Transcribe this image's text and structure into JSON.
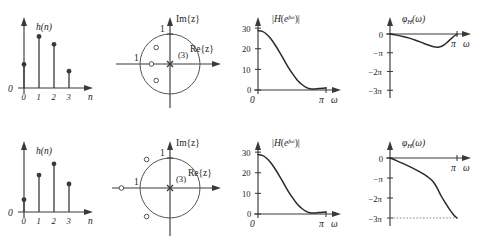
{
  "figure": {
    "colors": {
      "axis": "#3a3a3a",
      "curve": "#2a2a2a",
      "circle": "#555555",
      "dotted_reference": "#8a8a8a",
      "background": "#ffffff"
    }
  },
  "rows": [
    {
      "id": "minimum-phase",
      "impulse": {
        "ylabel": "h(n)",
        "xlabel": "n",
        "origin_label": "0",
        "xticks": [
          "0",
          "1",
          "2",
          "3"
        ],
        "samples": [
          {
            "n": 0,
            "value": 0.42
          },
          {
            "n": 1,
            "value": 0.92
          },
          {
            "n": 2,
            "value": 0.78
          },
          {
            "n": 3,
            "value": 0.3
          }
        ]
      },
      "polezero": {
        "imag_label": "Im{z}",
        "real_label": "Re{z}",
        "unit_label_imag": "1",
        "unit_label_real": "1",
        "pole_order_label": "(3)",
        "pole_at_origin_order": 3,
        "unit_circle_radius": 1,
        "zeros": [
          {
            "re": -0.46,
            "im": 0.55
          },
          {
            "re": -0.62,
            "im": 0.0
          },
          {
            "re": -0.46,
            "im": -0.55
          }
        ],
        "zeros_location": "inside unit circle"
      },
      "magnitude": {
        "ylabel": "|H(e^{jω})|",
        "xlabel": "ω",
        "origin_label": "0",
        "xtick_pi": "π",
        "yticks": [
          "0",
          "10",
          "20",
          "30"
        ],
        "ylim": [
          0,
          32
        ],
        "xlim": [
          0,
          3.14159
        ],
        "points": [
          {
            "w": 0.0,
            "mag": 28.8
          },
          {
            "w": 0.2,
            "mag": 28.4
          },
          {
            "w": 0.4,
            "mag": 27.0
          },
          {
            "w": 0.6,
            "mag": 24.7
          },
          {
            "w": 0.8,
            "mag": 21.7
          },
          {
            "w": 1.0,
            "mag": 18.3
          },
          {
            "w": 1.2,
            "mag": 14.6
          },
          {
            "w": 1.4,
            "mag": 11.0
          },
          {
            "w": 1.6,
            "mag": 7.8
          },
          {
            "w": 1.8,
            "mag": 5.0
          },
          {
            "w": 2.0,
            "mag": 2.9
          },
          {
            "w": 2.2,
            "mag": 1.4
          },
          {
            "w": 2.4,
            "mag": 0.6
          },
          {
            "w": 2.6,
            "mag": 0.5
          },
          {
            "w": 2.8,
            "mag": 0.7
          },
          {
            "w": 3.0,
            "mag": 0.9
          },
          {
            "w": 3.14159,
            "mag": 1.0
          }
        ]
      },
      "phase": {
        "ylabel": "φ",
        "ylabel_sub": "H",
        "ylabel_arg": "(ω)",
        "xlabel": "ω",
        "xtick_pi": "π",
        "yticks": [
          "0",
          "−π",
          "−2π",
          "−3π"
        ],
        "ylim_pi": [
          -3.2,
          0.25
        ],
        "reference_line": null,
        "points": [
          {
            "w": 0.0,
            "phase_pi": 0.0
          },
          {
            "w": 0.3,
            "phase_pi": -0.06
          },
          {
            "w": 0.6,
            "phase_pi": -0.13
          },
          {
            "w": 0.9,
            "phase_pi": -0.22
          },
          {
            "w": 1.2,
            "phase_pi": -0.33
          },
          {
            "w": 1.5,
            "phase_pi": -0.46
          },
          {
            "w": 1.8,
            "phase_pi": -0.59
          },
          {
            "w": 2.05,
            "phase_pi": -0.68
          },
          {
            "w": 2.25,
            "phase_pi": -0.7
          },
          {
            "w": 2.45,
            "phase_pi": -0.64
          },
          {
            "w": 2.65,
            "phase_pi": -0.48
          },
          {
            "w": 2.85,
            "phase_pi": -0.27
          },
          {
            "w": 3.0,
            "phase_pi": -0.12
          },
          {
            "w": 3.14159,
            "phase_pi": -0.02
          }
        ]
      }
    },
    {
      "id": "non-minimum-phase",
      "impulse": {
        "ylabel": "h(n)",
        "xlabel": "n",
        "origin_label": "0",
        "xticks": [
          "0",
          "1",
          "2",
          "3"
        ],
        "samples": [
          {
            "n": 0,
            "value": 0.22
          },
          {
            "n": 1,
            "value": 0.66
          },
          {
            "n": 2,
            "value": 0.86
          },
          {
            "n": 3,
            "value": 0.5
          }
        ]
      },
      "polezero": {
        "imag_label": "Im{z}",
        "real_label": "Re{z}",
        "unit_label_imag": "1",
        "unit_label_real": "1",
        "pole_order_label": "(3)",
        "pole_at_origin_order": 3,
        "unit_circle_radius": 1,
        "zeros": [
          {
            "re": -0.78,
            "im": 0.95
          },
          {
            "re": -1.62,
            "im": 0.0
          },
          {
            "re": -0.78,
            "im": -0.95
          }
        ],
        "zeros_location": "outside unit circle"
      },
      "magnitude": {
        "ylabel": "|H(e^{jω})|",
        "xlabel": "ω",
        "origin_label": "0",
        "xtick_pi": "π",
        "yticks": [
          "0",
          "10",
          "20",
          "30"
        ],
        "ylim": [
          0,
          32
        ],
        "xlim": [
          0,
          3.14159
        ],
        "points": [
          {
            "w": 0.0,
            "mag": 28.8
          },
          {
            "w": 0.2,
            "mag": 28.4
          },
          {
            "w": 0.4,
            "mag": 27.0
          },
          {
            "w": 0.6,
            "mag": 24.7
          },
          {
            "w": 0.8,
            "mag": 21.7
          },
          {
            "w": 1.0,
            "mag": 18.3
          },
          {
            "w": 1.2,
            "mag": 14.6
          },
          {
            "w": 1.4,
            "mag": 11.0
          },
          {
            "w": 1.6,
            "mag": 7.8
          },
          {
            "w": 1.8,
            "mag": 5.0
          },
          {
            "w": 2.0,
            "mag": 2.9
          },
          {
            "w": 2.2,
            "mag": 1.4
          },
          {
            "w": 2.4,
            "mag": 0.6
          },
          {
            "w": 2.6,
            "mag": 0.5
          },
          {
            "w": 2.8,
            "mag": 0.7
          },
          {
            "w": 3.0,
            "mag": 0.9
          },
          {
            "w": 3.14159,
            "mag": 1.0
          }
        ]
      },
      "phase": {
        "ylabel": "φ",
        "ylabel_sub": "H",
        "ylabel_arg": "(ω)",
        "xlabel": "ω",
        "xtick_pi": "π",
        "yticks": [
          "0",
          "−π",
          "−2π",
          "−3π"
        ],
        "ylim_pi": [
          -3.2,
          0.25
        ],
        "reference_line": "−3π",
        "points": [
          {
            "w": 0.0,
            "phase_pi": 0.0
          },
          {
            "w": 0.3,
            "phase_pi": -0.13
          },
          {
            "w": 0.6,
            "phase_pi": -0.27
          },
          {
            "w": 0.9,
            "phase_pi": -0.42
          },
          {
            "w": 1.2,
            "phase_pi": -0.58
          },
          {
            "w": 1.5,
            "phase_pi": -0.76
          },
          {
            "w": 1.75,
            "phase_pi": -0.93
          },
          {
            "w": 1.95,
            "phase_pi": -1.1
          },
          {
            "w": 2.1,
            "phase_pi": -1.3
          },
          {
            "w": 2.25,
            "phase_pi": -1.58
          },
          {
            "w": 2.4,
            "phase_pi": -1.9
          },
          {
            "w": 2.6,
            "phase_pi": -2.25
          },
          {
            "w": 2.8,
            "phase_pi": -2.58
          },
          {
            "w": 3.0,
            "phase_pi": -2.86
          },
          {
            "w": 3.14159,
            "phase_pi": -3.0
          }
        ]
      }
    }
  ]
}
